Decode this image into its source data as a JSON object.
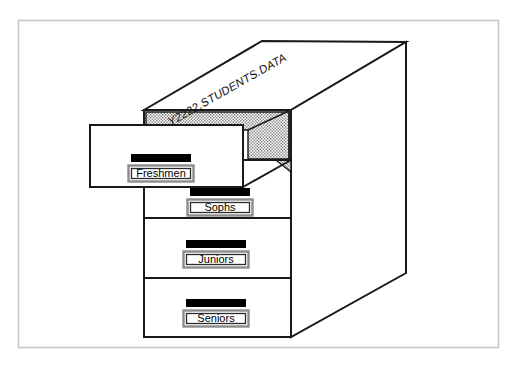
{
  "figure": {
    "type": "isometric-illustration",
    "background_color": "#ffffff",
    "frame": {
      "present": true,
      "color": "#c9c9c9",
      "x": 18,
      "y": 20,
      "width": 481,
      "height": 328
    }
  },
  "cabinet": {
    "dataset_label": "Y2222.STUDENTS.DATA",
    "body_color": "#ffffff",
    "outline_color": "#1a1a1a",
    "shadow_fill": "#b8b8b8",
    "top_face": {
      "name": "cabinet-top",
      "points": "144,110 262,41 406,42 291,110"
    },
    "side_face": {
      "name": "cabinet-side",
      "points": "291,110 406,42 406,273 291,337"
    },
    "front_face": {
      "name": "cabinet-front",
      "x": 144,
      "y": 110,
      "width": 147,
      "height": 227
    },
    "top_inner_shadow": {
      "name": "cabinet-top-recess",
      "points": "146,112 289,112 289,160 247,160 247,130 146,130"
    },
    "small_gusset": {
      "name": "drawer-gap-gusset",
      "points": "278,160 291,160 291,172"
    }
  },
  "drawers": [
    {
      "id": "freshmen",
      "label": "Freshmen",
      "state": "open",
      "face": {
        "x": 90,
        "y": 125,
        "width": 153,
        "height": 62
      },
      "handle": {
        "x": 131,
        "y": 154,
        "width": 60,
        "height": 8
      },
      "plate": {
        "x": 128,
        "y": 165,
        "width": 66,
        "height": 17
      }
    },
    {
      "id": "sophs",
      "label": "Sophs",
      "state": "closed",
      "face": {
        "x": 144,
        "y": 160,
        "width": 147,
        "height": 58
      },
      "handle": {
        "x": 190,
        "y": 188,
        "width": 60,
        "height": 8
      },
      "plate": {
        "x": 187,
        "y": 199,
        "width": 66,
        "height": 17
      }
    },
    {
      "id": "juniors",
      "label": "Juniors",
      "state": "closed",
      "face": {
        "x": 144,
        "y": 218,
        "width": 147,
        "height": 60
      },
      "handle": {
        "x": 186,
        "y": 240,
        "width": 60,
        "height": 8
      },
      "plate": {
        "x": 183,
        "y": 251,
        "width": 66,
        "height": 17
      }
    },
    {
      "id": "seniors",
      "label": "Seniors",
      "state": "closed",
      "face": {
        "x": 144,
        "y": 278,
        "width": 147,
        "height": 59
      },
      "handle": {
        "x": 186,
        "y": 299,
        "width": 60,
        "height": 8
      },
      "plate": {
        "x": 183,
        "y": 310,
        "width": 66,
        "height": 17
      }
    }
  ],
  "colors": {
    "ink": "#1a1a1a",
    "handle": "#000000",
    "plate_border_outer": "#8c8c8c",
    "plate_border_inner": "#2b2b2b",
    "plate_fill": "#ffffff",
    "hatch_light": "#ffffff",
    "hatch_dark": "#9a9a9a",
    "frame": "#c9c9c9"
  }
}
